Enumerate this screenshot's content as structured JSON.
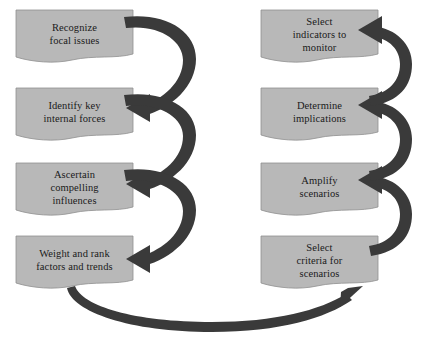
{
  "diagram": {
    "type": "process-flow",
    "colors": {
      "box_fill": "#b8b8b8",
      "box_stroke": "#8f8f8f",
      "arrow": "#3a3a3a",
      "text": "#1a1a1a",
      "background": "#ffffff"
    },
    "left_column": {
      "steps": [
        {
          "id": "recognize-focal-issues",
          "label": "Recognize\nfocal issues",
          "order": 1
        },
        {
          "id": "identify-key-internal-forces",
          "label": "Identify key\ninternal forces",
          "order": 2
        },
        {
          "id": "ascertain-compelling-influences",
          "label": "Ascertain\ncompelling\ninfluences",
          "order": 3
        },
        {
          "id": "weight-and-rank-factors-and-trends",
          "label": "Weight and rank\nfactors and trends",
          "order": 4
        }
      ]
    },
    "right_column": {
      "steps": [
        {
          "id": "select-indicators-to-monitor",
          "label": "Select\nindicators to\nmonitor",
          "order": 8
        },
        {
          "id": "determine-implications",
          "label": "Determine\nimplications",
          "order": 7
        },
        {
          "id": "amplify-scenarios",
          "label": "Amplify\nscenarios",
          "order": 6
        },
        {
          "id": "select-criteria-for-scenarios",
          "label": "Select\ncriteria for\nscenarios",
          "order": 5
        }
      ]
    },
    "connectors": [
      {
        "id": "left-1-to-2",
        "from": "recognize-focal-issues",
        "to": "identify-key-internal-forces",
        "shape": "c-curve",
        "direction": "downward"
      },
      {
        "id": "left-2-to-3",
        "from": "identify-key-internal-forces",
        "to": "ascertain-compelling-influences",
        "shape": "c-curve",
        "direction": "downward"
      },
      {
        "id": "left-3-to-4",
        "from": "ascertain-compelling-influences",
        "to": "weight-and-rank-factors-and-trends",
        "shape": "c-curve",
        "direction": "downward"
      },
      {
        "id": "bottom-feedback",
        "from": "weight-and-rank-factors-and-trends",
        "to": "select-criteria-for-scenarios",
        "shape": "tapered-arc",
        "direction": "left-to-right"
      },
      {
        "id": "right-4-to-3",
        "from": "select-criteria-for-scenarios",
        "to": "amplify-scenarios",
        "shape": "c-curve",
        "direction": "upward"
      },
      {
        "id": "right-3-to-2",
        "from": "amplify-scenarios",
        "to": "determine-implications",
        "shape": "c-curve",
        "direction": "upward"
      },
      {
        "id": "right-2-to-1",
        "from": "determine-implications",
        "to": "select-indicators-to-monitor",
        "shape": "c-curve",
        "direction": "upward"
      }
    ]
  }
}
